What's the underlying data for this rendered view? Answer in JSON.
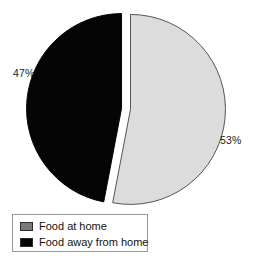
{
  "chart_data": {
    "type": "pie",
    "title": "",
    "categories": [
      "Food at home",
      "Food away from home"
    ],
    "values": [
      53,
      47
    ],
    "value_labels": [
      "53%",
      "47%"
    ],
    "units": "percent",
    "legend_position": "bottom-left",
    "grid": false,
    "slices": [
      {
        "label": "Food at home",
        "value": 53,
        "value_label": "53%",
        "color": "#dcdcdc",
        "outline_color": "#555555",
        "exploded": true,
        "label_position": "right"
      },
      {
        "label": "Food away from home",
        "value": 47,
        "value_label": "47%",
        "color": "#050505",
        "outline_color": "#050505",
        "exploded": true,
        "label_position": "left"
      }
    ]
  },
  "labels": {
    "left_percent": "47%",
    "right_percent": "53%"
  },
  "legend": {
    "items": [
      {
        "label": "Food at home",
        "swatch_color": "#7a7a7a"
      },
      {
        "label": "Food away from home",
        "swatch_color": "#050505"
      }
    ]
  },
  "colors": {
    "background": "#ffffff",
    "slice_gray": "#dcdcdc",
    "slice_black": "#050505",
    "legend_swatch_gray": "#7a7a7a",
    "legend_border": "#9a9a9a",
    "text": "#111111"
  }
}
